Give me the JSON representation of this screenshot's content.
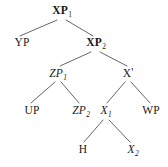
{
  "diagram": {
    "type": "syntax-tree",
    "kind": "x-bar phrase structure tree",
    "width": 168,
    "height": 167,
    "background_color": "#ffffff",
    "line_color": "#555555",
    "text_color": "#1a1a1a"
  },
  "nodes": [
    {
      "id": "xp1",
      "label": "XP",
      "subscript": "1",
      "prime": "",
      "style": "bold",
      "x": 62,
      "y": 11
    },
    {
      "id": "yp",
      "label": "YP",
      "subscript": "",
      "prime": "",
      "style": "regular",
      "x": 22,
      "y": 43
    },
    {
      "id": "xp2",
      "label": "XP",
      "subscript": "2",
      "prime": "",
      "style": "bold",
      "x": 96,
      "y": 43
    },
    {
      "id": "zp1",
      "label": "ZP",
      "subscript": "1",
      "prime": "",
      "style": "italic",
      "x": 58,
      "y": 74
    },
    {
      "id": "xbar",
      "label": "X",
      "subscript": "",
      "prime": "'",
      "style": "regular",
      "x": 128,
      "y": 74
    },
    {
      "id": "up",
      "label": "UP",
      "subscript": "",
      "prime": "",
      "style": "regular",
      "x": 32,
      "y": 111
    },
    {
      "id": "zp2",
      "label": "ZP",
      "subscript": "2",
      "prime": "",
      "style": "italic",
      "x": 81,
      "y": 111
    },
    {
      "id": "x1",
      "label": "X",
      "subscript": "1",
      "prime": "",
      "style": "italic",
      "x": 106,
      "y": 111
    },
    {
      "id": "wp",
      "label": "WP",
      "subscript": "",
      "prime": "",
      "style": "regular",
      "x": 151,
      "y": 111
    },
    {
      "id": "h",
      "label": "H",
      "subscript": "",
      "prime": "",
      "style": "regular",
      "x": 83,
      "y": 150
    },
    {
      "id": "x2",
      "label": "X",
      "subscript": "2",
      "prime": "",
      "style": "italic",
      "x": 133,
      "y": 150
    }
  ],
  "edges": [
    {
      "from": "xp1",
      "to": "yp",
      "x1": 57,
      "y1": 20,
      "x2": 20,
      "y2": 36
    },
    {
      "from": "xp1",
      "to": "xp2",
      "x1": 66,
      "y1": 20,
      "x2": 93,
      "y2": 36
    },
    {
      "from": "xp2",
      "to": "zp1",
      "x1": 91,
      "y1": 52,
      "x2": 60,
      "y2": 66
    },
    {
      "from": "xp2",
      "to": "xbar",
      "x1": 100,
      "y1": 52,
      "x2": 127,
      "y2": 66
    },
    {
      "from": "zp1",
      "to": "up",
      "x1": 55,
      "y1": 82,
      "x2": 31,
      "y2": 103
    },
    {
      "from": "zp1",
      "to": "zp2",
      "x1": 61,
      "y1": 82,
      "x2": 79,
      "y2": 103
    },
    {
      "from": "xbar",
      "to": "x1",
      "x1": 125,
      "y1": 82,
      "x2": 107,
      "y2": 103
    },
    {
      "from": "xbar",
      "to": "wp",
      "x1": 131,
      "y1": 82,
      "x2": 150,
      "y2": 103
    },
    {
      "from": "x1",
      "to": "h",
      "x1": 103,
      "y1": 120,
      "x2": 84,
      "y2": 142
    },
    {
      "from": "x1",
      "to": "x2",
      "x1": 109,
      "y1": 120,
      "x2": 130,
      "y2": 142
    }
  ]
}
